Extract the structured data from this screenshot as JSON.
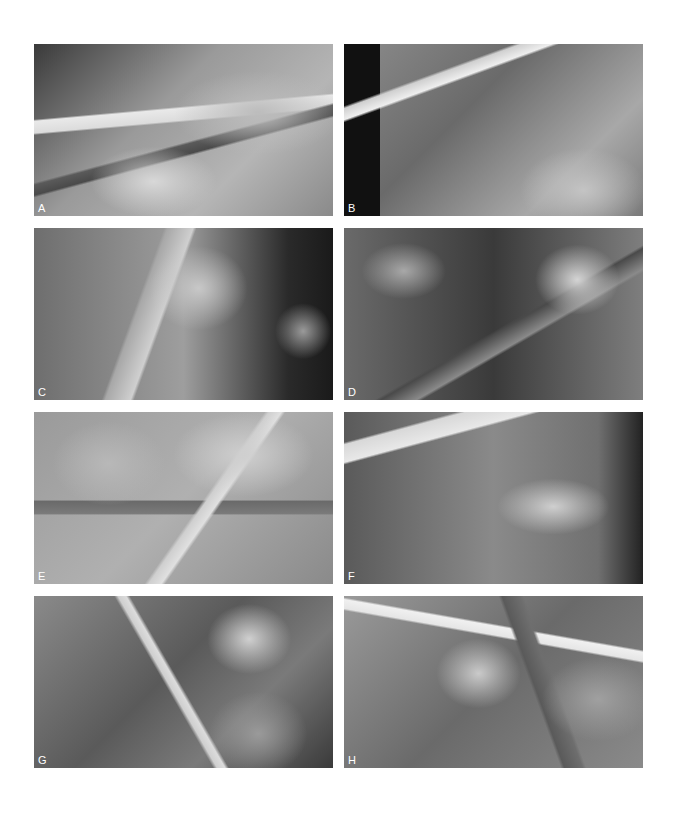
{
  "figure": {
    "panels": [
      {
        "label": "A",
        "description": "laparoscopic dissection with instruments and vessels"
      },
      {
        "label": "B",
        "description": "grasper holding white vessel loops"
      },
      {
        "label": "C",
        "description": "clip applier on tissue with gauze"
      },
      {
        "label": "D",
        "description": "instrument in dark cavity with gauze"
      },
      {
        "label": "E",
        "description": "clipped stapled tissue with instruments"
      },
      {
        "label": "F",
        "description": "vessel loops and dissected tissue"
      },
      {
        "label": "G",
        "description": "retracted tissue mass and bowel"
      },
      {
        "label": "H",
        "description": "suction device and sutured tissue"
      }
    ]
  }
}
